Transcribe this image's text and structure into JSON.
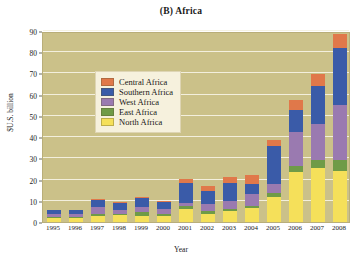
{
  "chart_data": {
    "type": "bar",
    "subtype": "stacked-bar",
    "title": "(B) Africa",
    "xlabel": "Year",
    "ylabel": "$U.S. billion",
    "ylim": [
      0,
      90
    ],
    "ytick_step": 10,
    "yticks": [
      0,
      10,
      20,
      30,
      40,
      50,
      60,
      70,
      80,
      90
    ],
    "grid": true,
    "grid_axis": "y",
    "legend_position": "upper-left-inside",
    "categories": [
      "1995",
      "1996",
      "1997",
      "1998",
      "1999",
      "2000",
      "2001",
      "2002",
      "2003",
      "2004",
      "2005",
      "2006",
      "2007",
      "2008"
    ],
    "series": [
      {
        "name": "North Africa",
        "color": "#f5e05a",
        "values": [
          2.0,
          2.0,
          3.0,
          3.2,
          3.0,
          3.0,
          6.0,
          3.8,
          5.0,
          6.5,
          12.0,
          23.5,
          25.5,
          24.0
        ]
      },
      {
        "name": "East Africa",
        "color": "#6f9b47",
        "values": [
          0.6,
          0.5,
          1.0,
          0.8,
          1.5,
          0.8,
          1.5,
          1.2,
          1.0,
          1.0,
          1.5,
          3.0,
          3.5,
          5.0
        ]
      },
      {
        "name": "West Africa",
        "color": "#9a7ab0",
        "values": [
          1.4,
          1.5,
          3.0,
          1.8,
          2.5,
          2.2,
          1.5,
          3.5,
          4.0,
          5.5,
          4.5,
          16.0,
          17.0,
          26.0
        ]
      },
      {
        "name": "Southern Africa",
        "color": "#3a5ba8",
        "values": [
          1.5,
          1.5,
          3.5,
          3.2,
          4.5,
          3.5,
          9.5,
          6.0,
          8.5,
          5.0,
          18.0,
          10.5,
          18.0,
          27.0
        ]
      },
      {
        "name": "Central Africa",
        "color": "#e0784a",
        "values": [
          0.0,
          0.0,
          0.5,
          0.5,
          0.5,
          0.5,
          2.0,
          2.5,
          2.5,
          4.0,
          2.5,
          4.5,
          6.0,
          6.5
        ]
      }
    ],
    "totals": [
      5.5,
      5.5,
      11.0,
      9.5,
      12.0,
      10.0,
      20.5,
      17.0,
      21.0,
      22.0,
      38.5,
      57.5,
      70.0,
      88.5
    ],
    "legend": [
      {
        "label": "Central Africa",
        "color": "#e0784a"
      },
      {
        "label": "Southern Africa",
        "color": "#3a5ba8"
      },
      {
        "label": "West Africa",
        "color": "#9a7ab0"
      },
      {
        "label": "East Africa",
        "color": "#6f9b47"
      },
      {
        "label": "North Africa",
        "color": "#f5e05a"
      }
    ],
    "plot_background": "#cbc189",
    "legend_background": "#f6f1dd",
    "gridline_color": "#f4f1e2"
  }
}
